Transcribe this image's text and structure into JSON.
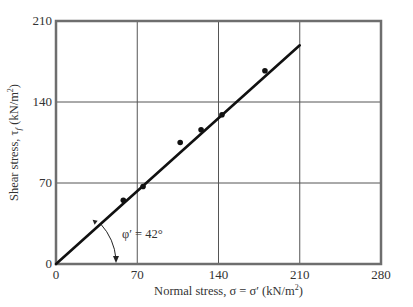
{
  "chart_data": {
    "type": "scatter",
    "title": "",
    "xlabel": "Normal stress, σ = σ′ (kN/m²)",
    "ylabel": "Shear stress, τf (kN/m²)",
    "xlim": [
      0,
      280
    ],
    "ylim": [
      0,
      210
    ],
    "xticks": [
      0,
      70,
      140,
      210,
      280
    ],
    "yticks": [
      0,
      70,
      140,
      210
    ],
    "grid": true,
    "legend": null,
    "series": [
      {
        "name": "Test results",
        "kind": "points",
        "x": [
          58,
          75,
          107,
          125,
          143,
          180
        ],
        "y": [
          55,
          67,
          105,
          116,
          129,
          167
        ]
      },
      {
        "name": "Failure envelope",
        "kind": "line",
        "x": [
          0,
          210
        ],
        "y": [
          0,
          189
        ]
      }
    ],
    "annotations": [
      {
        "text": "φ′ = 42°",
        "x": 75,
        "y": 30,
        "note": "angle between failure envelope and x-axis"
      }
    ]
  },
  "labels": {
    "x_axis": "Normal stress, σ = σ′ (kN/m²)",
    "y_axis": "Shear stress, τf (kN/m²)",
    "angle": "φ′ = 42°"
  },
  "style": {
    "frame_color": "#6e6e6e",
    "grid_color": "#555555",
    "line_color": "#111111",
    "point_color": "#111111"
  }
}
